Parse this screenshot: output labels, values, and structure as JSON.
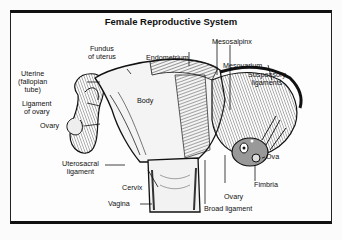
{
  "title": "Female Reproductive System",
  "labels": {
    "fundus": "Fundus\nof uterus",
    "endometrium": "Endometrium",
    "mesosalpinx": "Mesosalpinx",
    "mesovarium": "Mesovarium",
    "suspensory": "Suspensory\nligaments",
    "uterine_tube": "Uterine\n(fallopian\ntube)",
    "ligament_ovary": "Ligament\nof ovary",
    "ovary_left": "Ovary",
    "body": "Body",
    "uterosacral": "Uterosacral\nligament",
    "cervix": "Cervix",
    "vagina": "Vagina",
    "ova": "Ova",
    "fimbria": "Fimbria",
    "ovary_right": "Ovary",
    "broad_ligament": "Broad ligament"
  }
}
